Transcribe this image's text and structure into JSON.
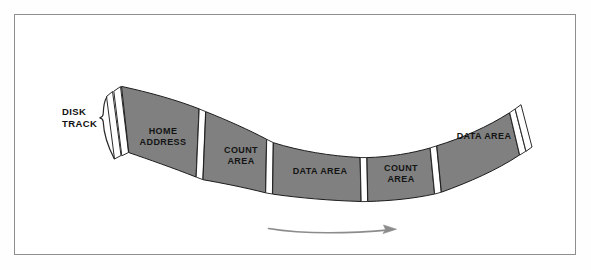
{
  "figure": {
    "background_color": "#ffffff",
    "border_color": "#8e8e8e",
    "segment_fill_color": "#808080",
    "segment_outline_color": "#1c1c1c",
    "gap_color": "#ffffff",
    "text_color": "#141414",
    "arrow_color": "#8c8c8c"
  },
  "annotation": {
    "disk_track_label_line1": "DISK",
    "disk_track_label_line2": "TRACK",
    "bracket_icon": "curly-brace-icon"
  },
  "track": {
    "orientation": "curved-arc-concave-up",
    "rotation_direction": "left-to-right",
    "segments": [
      {
        "id": "index-marker",
        "label": "",
        "type": "index-gap",
        "filled": false
      },
      {
        "id": "home-address",
        "label_line1": "HOME",
        "label_line2": "ADDRESS",
        "label": "HOME ADDRESS",
        "type": "home-address",
        "filled": true
      },
      {
        "id": "count-area-1",
        "label_line1": "COUNT",
        "label_line2": "AREA",
        "label": "COUNT AREA",
        "type": "count-area",
        "filled": true
      },
      {
        "id": "data-area-1",
        "label_line1": "DATA AREA",
        "label_line2": "",
        "label": "DATA AREA",
        "type": "data-area",
        "filled": true
      },
      {
        "id": "count-area-2",
        "label_line1": "COUNT",
        "label_line2": "AREA",
        "label": "COUNT AREA",
        "type": "count-area",
        "filled": true
      },
      {
        "id": "data-area-2",
        "label_line1": "DATA AREA",
        "label_line2": "",
        "label": "DATA AREA",
        "type": "data-area",
        "filled": true
      },
      {
        "id": "end-marker",
        "label": "",
        "type": "end-gap",
        "filled": false
      }
    ]
  },
  "direction_arrow": {
    "name": "rotation-direction-arrow",
    "points": "right",
    "label": ""
  }
}
